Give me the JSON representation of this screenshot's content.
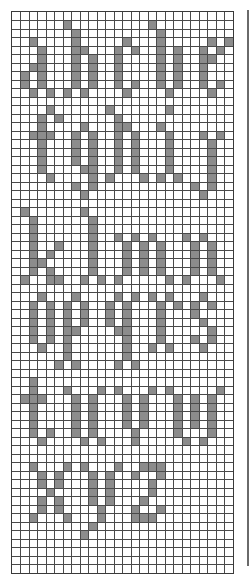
{
  "chart": {
    "cols": 26,
    "rows": 66,
    "cell_size": 8.5,
    "fill_color": "#8c8c8c",
    "line_color": "#4a4a4a",
    "background": "#ffffff"
  },
  "letters": [
    {
      "char": "a",
      "cells": [
        [
          3,
          2
        ],
        [
          4,
          3
        ],
        [
          5,
          3
        ],
        [
          6,
          2
        ],
        [
          6,
          3
        ],
        [
          7,
          1
        ],
        [
          7,
          3
        ],
        [
          8,
          1
        ],
        [
          8,
          3
        ],
        [
          9,
          2
        ],
        [
          9,
          4
        ]
      ]
    },
    {
      "char": "b",
      "cells": [
        [
          1,
          6
        ],
        [
          2,
          7
        ],
        [
          3,
          7
        ],
        [
          4,
          7
        ],
        [
          4,
          8
        ],
        [
          5,
          7
        ],
        [
          5,
          9
        ],
        [
          6,
          7
        ],
        [
          6,
          9
        ],
        [
          7,
          7
        ],
        [
          7,
          9
        ],
        [
          8,
          7
        ],
        [
          8,
          9
        ],
        [
          9,
          6
        ],
        [
          9,
          8
        ]
      ]
    },
    {
      "char": "c",
      "cells": [
        [
          3,
          13
        ],
        [
          4,
          12
        ],
        [
          4,
          14
        ],
        [
          5,
          12
        ],
        [
          6,
          12
        ],
        [
          7,
          12
        ],
        [
          8,
          12
        ],
        [
          8,
          14
        ],
        [
          9,
          13
        ]
      ]
    },
    {
      "char": "d",
      "cells": [
        [
          1,
          16
        ],
        [
          2,
          17
        ],
        [
          3,
          17
        ],
        [
          4,
          17
        ],
        [
          4,
          19
        ],
        [
          5,
          17
        ],
        [
          5,
          19
        ],
        [
          6,
          17
        ],
        [
          6,
          19
        ],
        [
          7,
          17
        ],
        [
          7,
          19
        ],
        [
          8,
          17
        ],
        [
          8,
          19
        ],
        [
          9,
          18
        ]
      ]
    },
    {
      "char": "e",
      "cells": [
        [
          3,
          23
        ],
        [
          3,
          25
        ],
        [
          4,
          22
        ],
        [
          4,
          24
        ],
        [
          5,
          22
        ],
        [
          5,
          23
        ],
        [
          6,
          22
        ],
        [
          7,
          22
        ],
        [
          8,
          22
        ],
        [
          8,
          24
        ],
        [
          9,
          23
        ]
      ]
    },
    {
      "char": "f",
      "cells": [
        [
          11,
          4
        ],
        [
          12,
          3
        ],
        [
          12,
          5
        ],
        [
          13,
          3
        ],
        [
          14,
          2
        ],
        [
          14,
          3
        ],
        [
          14,
          4
        ],
        [
          15,
          3
        ],
        [
          16,
          3
        ],
        [
          17,
          3
        ],
        [
          18,
          3
        ],
        [
          19,
          4
        ]
      ]
    },
    {
      "char": "g",
      "cells": [
        [
          13,
          8
        ],
        [
          14,
          7
        ],
        [
          14,
          9
        ],
        [
          15,
          7
        ],
        [
          15,
          9
        ],
        [
          16,
          7
        ],
        [
          16,
          9
        ],
        [
          17,
          7
        ],
        [
          17,
          9
        ],
        [
          18,
          8
        ],
        [
          18,
          9
        ],
        [
          19,
          9
        ],
        [
          20,
          7
        ],
        [
          20,
          9
        ],
        [
          21,
          8
        ]
      ]
    },
    {
      "char": "h",
      "cells": [
        [
          11,
          11
        ],
        [
          12,
          12
        ],
        [
          13,
          12
        ],
        [
          13,
          13
        ],
        [
          14,
          12
        ],
        [
          14,
          14
        ],
        [
          15,
          12
        ],
        [
          15,
          14
        ],
        [
          16,
          12
        ],
        [
          16,
          14
        ],
        [
          17,
          12
        ],
        [
          17,
          14
        ],
        [
          18,
          12
        ],
        [
          18,
          14
        ],
        [
          19,
          11
        ],
        [
          19,
          15
        ]
      ]
    },
    {
      "char": "i",
      "cells": [
        [
          11,
          18
        ],
        [
          13,
          17
        ],
        [
          14,
          18
        ],
        [
          15,
          18
        ],
        [
          16,
          18
        ],
        [
          17,
          18
        ],
        [
          18,
          18
        ],
        [
          19,
          17
        ],
        [
          19,
          19
        ]
      ]
    },
    {
      "char": "j",
      "cells": [
        [
          14,
          22
        ],
        [
          14,
          24
        ],
        [
          15,
          23
        ],
        [
          16,
          23
        ],
        [
          17,
          23
        ],
        [
          18,
          23
        ],
        [
          19,
          23
        ],
        [
          20,
          21
        ],
        [
          20,
          23
        ],
        [
          21,
          22
        ]
      ]
    },
    {
      "char": "k",
      "cells": [
        [
          23,
          1
        ],
        [
          24,
          2
        ],
        [
          25,
          2
        ],
        [
          26,
          2
        ],
        [
          27,
          2
        ],
        [
          27,
          5
        ],
        [
          28,
          2
        ],
        [
          28,
          4
        ],
        [
          29,
          2
        ],
        [
          29,
          3
        ],
        [
          30,
          2
        ],
        [
          30,
          4
        ],
        [
          31,
          1
        ],
        [
          31,
          4
        ],
        [
          31,
          5
        ]
      ]
    },
    {
      "char": "l",
      "cells": [
        [
          23,
          8
        ],
        [
          24,
          9
        ],
        [
          25,
          9
        ],
        [
          26,
          9
        ],
        [
          27,
          9
        ],
        [
          28,
          9
        ],
        [
          29,
          9
        ],
        [
          30,
          9
        ],
        [
          31,
          8
        ],
        [
          31,
          10
        ]
      ]
    },
    {
      "char": "m",
      "cells": [
        [
          26,
          12
        ],
        [
          26,
          14
        ],
        [
          26,
          16
        ],
        [
          27,
          13
        ],
        [
          27,
          15
        ],
        [
          27,
          17
        ],
        [
          28,
          13
        ],
        [
          28,
          15
        ],
        [
          28,
          17
        ],
        [
          29,
          13
        ],
        [
          29,
          15
        ],
        [
          29,
          17
        ],
        [
          30,
          13
        ],
        [
          30,
          15
        ],
        [
          30,
          17
        ],
        [
          31,
          12
        ],
        [
          31,
          18
        ]
      ]
    },
    {
      "char": "n",
      "cells": [
        [
          26,
          20
        ],
        [
          26,
          22
        ],
        [
          27,
          21
        ],
        [
          27,
          23
        ],
        [
          28,
          21
        ],
        [
          28,
          23
        ],
        [
          29,
          21
        ],
        [
          29,
          23
        ],
        [
          30,
          21
        ],
        [
          30,
          23
        ],
        [
          31,
          20
        ],
        [
          31,
          24
        ]
      ]
    },
    {
      "char": "o",
      "cells": [
        [
          33,
          3
        ],
        [
          34,
          2
        ],
        [
          34,
          4
        ],
        [
          35,
          2
        ],
        [
          35,
          4
        ],
        [
          36,
          2
        ],
        [
          36,
          4
        ],
        [
          37,
          2
        ],
        [
          37,
          4
        ],
        [
          38,
          2
        ],
        [
          38,
          4
        ],
        [
          39,
          3
        ]
      ]
    },
    {
      "char": "p",
      "cells": [
        [
          33,
          7
        ],
        [
          34,
          6
        ],
        [
          34,
          8
        ],
        [
          35,
          6
        ],
        [
          35,
          8
        ],
        [
          36,
          6
        ],
        [
          36,
          8
        ],
        [
          37,
          6
        ],
        [
          37,
          7
        ],
        [
          38,
          6
        ],
        [
          39,
          6
        ],
        [
          40,
          6
        ],
        [
          41,
          5
        ],
        [
          41,
          7
        ]
      ]
    },
    {
      "char": "q",
      "cells": [
        [
          33,
          12
        ],
        [
          33,
          14
        ],
        [
          34,
          11
        ],
        [
          34,
          13
        ],
        [
          35,
          11
        ],
        [
          35,
          13
        ],
        [
          36,
          11
        ],
        [
          36,
          13
        ],
        [
          37,
          12
        ],
        [
          37,
          13
        ],
        [
          38,
          13
        ],
        [
          39,
          13
        ],
        [
          40,
          13
        ],
        [
          41,
          12
        ],
        [
          41,
          14
        ]
      ]
    },
    {
      "char": "r",
      "cells": [
        [
          33,
          16
        ],
        [
          33,
          18
        ],
        [
          34,
          17
        ],
        [
          34,
          19
        ],
        [
          35,
          17
        ],
        [
          36,
          17
        ],
        [
          37,
          17
        ],
        [
          38,
          17
        ],
        [
          39,
          16
        ],
        [
          39,
          18
        ]
      ]
    },
    {
      "char": "s",
      "cells": [
        [
          33,
          22
        ],
        [
          34,
          21
        ],
        [
          34,
          23
        ],
        [
          35,
          21
        ],
        [
          36,
          22
        ],
        [
          37,
          23
        ],
        [
          38,
          21
        ],
        [
          38,
          23
        ],
        [
          39,
          22
        ]
      ]
    },
    {
      "char": "t",
      "cells": [
        [
          43,
          2
        ],
        [
          44,
          2
        ],
        [
          45,
          1
        ],
        [
          45,
          2
        ],
        [
          45,
          3
        ],
        [
          46,
          2
        ],
        [
          47,
          2
        ],
        [
          48,
          2
        ],
        [
          49,
          2
        ],
        [
          49,
          4
        ],
        [
          50,
          3
        ]
      ]
    },
    {
      "char": "u",
      "cells": [
        [
          44,
          6
        ],
        [
          44,
          10
        ],
        [
          45,
          7
        ],
        [
          45,
          9
        ],
        [
          46,
          7
        ],
        [
          46,
          9
        ],
        [
          47,
          7
        ],
        [
          47,
          9
        ],
        [
          48,
          7
        ],
        [
          48,
          9
        ],
        [
          49,
          7
        ],
        [
          49,
          9
        ],
        [
          50,
          8
        ],
        [
          50,
          10
        ]
      ]
    },
    {
      "char": "v",
      "cells": [
        [
          44,
          12
        ],
        [
          44,
          16
        ],
        [
          45,
          13
        ],
        [
          45,
          15
        ],
        [
          46,
          13
        ],
        [
          46,
          15
        ],
        [
          47,
          13
        ],
        [
          47,
          15
        ],
        [
          48,
          13
        ],
        [
          48,
          15
        ],
        [
          49,
          14
        ],
        [
          50,
          14
        ]
      ]
    },
    {
      "char": "w",
      "cells": [
        [
          44,
          18
        ],
        [
          44,
          24
        ],
        [
          45,
          19
        ],
        [
          45,
          21
        ],
        [
          45,
          23
        ],
        [
          46,
          19
        ],
        [
          46,
          21
        ],
        [
          46,
          23
        ],
        [
          47,
          19
        ],
        [
          47,
          21
        ],
        [
          47,
          23
        ],
        [
          48,
          19
        ],
        [
          48,
          21
        ],
        [
          48,
          23
        ],
        [
          49,
          19
        ],
        [
          49,
          23
        ],
        [
          50,
          20
        ],
        [
          50,
          22
        ]
      ]
    },
    {
      "char": "x",
      "cells": [
        [
          53,
          2
        ],
        [
          53,
          6
        ],
        [
          54,
          3
        ],
        [
          54,
          5
        ],
        [
          55,
          3
        ],
        [
          55,
          5
        ],
        [
          56,
          4
        ],
        [
          57,
          3
        ],
        [
          57,
          5
        ],
        [
          58,
          3
        ],
        [
          58,
          5
        ],
        [
          59,
          2
        ],
        [
          59,
          6
        ]
      ]
    },
    {
      "char": "y",
      "cells": [
        [
          53,
          8
        ],
        [
          53,
          12
        ],
        [
          54,
          9
        ],
        [
          54,
          11
        ],
        [
          55,
          9
        ],
        [
          55,
          11
        ],
        [
          56,
          9
        ],
        [
          56,
          11
        ],
        [
          57,
          9
        ],
        [
          57,
          11
        ],
        [
          58,
          10
        ],
        [
          59,
          10
        ],
        [
          60,
          9
        ],
        [
          61,
          8
        ]
      ]
    },
    {
      "char": "z",
      "cells": [
        [
          53,
          15
        ],
        [
          53,
          16
        ],
        [
          53,
          17
        ],
        [
          54,
          14
        ],
        [
          54,
          17
        ],
        [
          55,
          16
        ],
        [
          56,
          16
        ],
        [
          57,
          15
        ],
        [
          58,
          14
        ],
        [
          58,
          17
        ],
        [
          59,
          14
        ],
        [
          59,
          15
        ],
        [
          59,
          16
        ]
      ]
    }
  ]
}
